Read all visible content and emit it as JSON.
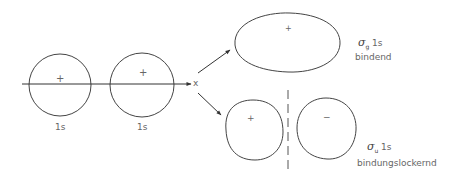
{
  "diagram": {
    "type": "molecular-orbital-formation",
    "atomic_orbitals": [
      {
        "label": "1s",
        "sign": "+"
      },
      {
        "label": "1s",
        "sign": "+"
      }
    ],
    "axis_label": "x",
    "bonding": {
      "symbol": "σ",
      "subscript": "g",
      "orbital": "1s",
      "description": "bindend",
      "sign": "+"
    },
    "antibonding": {
      "symbol": "σ",
      "subscript": "u",
      "orbital": "1s",
      "description": "bindungslockernd",
      "signs": [
        "+",
        "−"
      ]
    },
    "colors": {
      "line": "#444444",
      "text": "#666666"
    }
  }
}
